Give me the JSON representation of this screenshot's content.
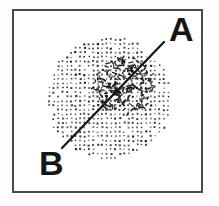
{
  "figure": {
    "type": "stipple-diagram",
    "labels": [
      {
        "id": "A",
        "text": "A",
        "x": 169,
        "y": 41
      },
      {
        "id": "B",
        "text": "B",
        "x": 39,
        "y": 175
      }
    ],
    "line": {
      "x1": 62,
      "y1": 148,
      "x2": 164,
      "y2": 42,
      "stroke_width": 2.2
    },
    "stipple_circle": {
      "cx": 109,
      "cy": 99,
      "r": 62,
      "dot_spacing": 4.4,
      "dot_size": 1.7
    },
    "noise_patch": {
      "cx": 124,
      "cy": 86,
      "r": 31,
      "dash_count": 200,
      "dash_min_len": 1.6,
      "dash_max_len": 4.6,
      "dash_width": 1.4
    },
    "frame": {
      "x": 12,
      "y": 9,
      "width": 191,
      "height": 184,
      "border_width": 2
    },
    "colors": {
      "ink": "#161616",
      "frame": "#4a4a4a",
      "background": "#fdfdfd"
    }
  }
}
